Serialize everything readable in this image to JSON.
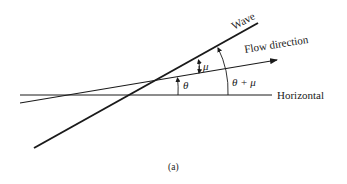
{
  "diagram": {
    "labels": {
      "wave": "Wave",
      "flow_direction": "Flow direction",
      "horizontal": "Horizontal",
      "theta": "θ",
      "mu": "μ",
      "theta_plus_mu": "θ + μ",
      "caption": "(a)"
    },
    "colors": {
      "line": "#1a1a1a",
      "background": "#ffffff"
    }
  }
}
